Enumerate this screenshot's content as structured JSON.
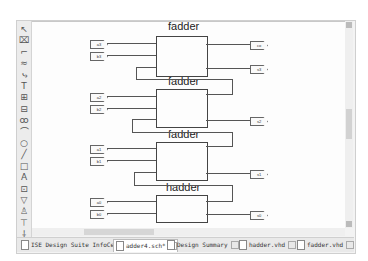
{
  "toolbar": {
    "tools": [
      {
        "name": "select-tool-icon",
        "glyph": "↖"
      },
      {
        "name": "wire-tool-icon",
        "glyph": "⌧"
      },
      {
        "name": "net-name-tool-icon",
        "glyph": "⌐"
      },
      {
        "name": "bus-tool-icon",
        "glyph": "≈"
      },
      {
        "name": "bus-tap-tool-icon",
        "glyph": "⤷"
      },
      {
        "name": "text-tool-icon",
        "glyph": "T"
      },
      {
        "name": "symbol-tool-icon",
        "glyph": "⊞"
      },
      {
        "name": "io-marker-tool-icon",
        "glyph": "⊟"
      },
      {
        "name": "add-symbol-tool-icon",
        "glyph": "ꝏ"
      },
      {
        "name": "arc-tool-icon",
        "glyph": "⌒"
      },
      {
        "name": "circle-tool-icon",
        "glyph": "○"
      },
      {
        "name": "line-tool-icon",
        "glyph": "╱"
      },
      {
        "name": "rectangle-tool-icon",
        "glyph": "□"
      },
      {
        "name": "label-tool-icon",
        "glyph": "A"
      },
      {
        "name": "attribute-tool-icon",
        "glyph": "⊡"
      },
      {
        "name": "pin-tool-icon",
        "glyph": "▽"
      },
      {
        "name": "hierarchy-tool-icon",
        "glyph": "♙"
      },
      {
        "name": "push-tool-icon",
        "glyph": "⊤"
      },
      {
        "name": "power-tool-icon",
        "glyph": "⸸"
      }
    ]
  },
  "schematic": {
    "blocks": [
      {
        "label": "fadder"
      },
      {
        "label": "fadder"
      },
      {
        "label": "fadder"
      },
      {
        "label": "hadder"
      }
    ],
    "inputs": [
      "a3",
      "b3",
      "a2",
      "b2",
      "a1",
      "b1",
      "a0",
      "b0"
    ],
    "outputs": [
      "co",
      "s3",
      "s2",
      "s1",
      "s0"
    ]
  },
  "tabs": [
    {
      "label": "ISE Design Suite InfoCenter",
      "active": false
    },
    {
      "label": "adder4.sch*",
      "active": true
    },
    {
      "label": "Design Summary",
      "active": false
    },
    {
      "label": "hadder.vhd",
      "active": false
    },
    {
      "label": "fadder.vhd",
      "active": false
    }
  ]
}
